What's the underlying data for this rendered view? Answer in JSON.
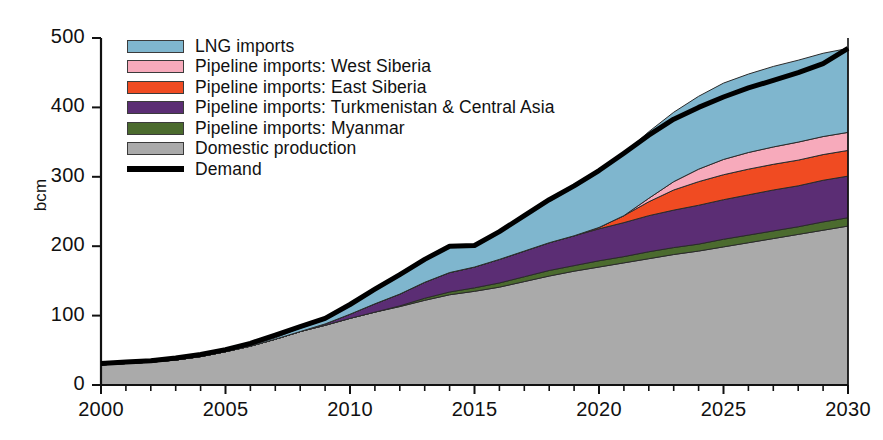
{
  "axes": {
    "y_label": "bcm",
    "y_ticks": [
      "0",
      "100",
      "200",
      "300",
      "400",
      "500"
    ],
    "x_ticks": [
      "2000",
      "2005",
      "2010",
      "2015",
      "2020",
      "2025",
      "2030"
    ]
  },
  "legend": {
    "items": [
      {
        "label": "LNG imports",
        "color": "#7FB6CE",
        "type": "area"
      },
      {
        "label": "Pipeline imports: West Siberia",
        "color": "#F7AABB",
        "type": "area"
      },
      {
        "label": "Pipeline imports: East Siberia",
        "color": "#F04B22",
        "type": "area"
      },
      {
        "label": "Pipeline imports: Turkmenistan & Central Asia",
        "color": "#5B2D74",
        "type": "area"
      },
      {
        "label": "Pipeline imports: Myanmar",
        "color": "#4B6B2E",
        "type": "area"
      },
      {
        "label": "Domestic production",
        "color": "#AAAAAA",
        "type": "area"
      },
      {
        "label": "Demand",
        "color": "#000000",
        "type": "line"
      }
    ]
  },
  "chart_data": {
    "type": "area",
    "title": "",
    "xlabel": "",
    "ylabel": "bcm",
    "xlim": [
      2000,
      2030
    ],
    "ylim": [
      0,
      500
    ],
    "grid": false,
    "legend_position": "top-left-inside",
    "stacked": true,
    "x": [
      2000,
      2001,
      2002,
      2003,
      2004,
      2005,
      2006,
      2007,
      2008,
      2009,
      2010,
      2011,
      2012,
      2013,
      2014,
      2015,
      2016,
      2017,
      2018,
      2019,
      2020,
      2021,
      2022,
      2023,
      2024,
      2025,
      2026,
      2027,
      2028,
      2029,
      2030
    ],
    "series": [
      {
        "name": "Domestic production",
        "color": "#AAAAAA",
        "values": [
          29,
          31,
          33,
          36,
          41,
          48,
          56,
          66,
          77,
          86,
          96,
          105,
          113,
          122,
          130,
          135,
          141,
          149,
          157,
          164,
          170,
          176,
          182,
          188,
          193,
          199,
          205,
          211,
          217,
          223,
          229
        ]
      },
      {
        "name": "Pipeline imports: Myanmar",
        "color": "#4B6B2E",
        "values": [
          0,
          0,
          0,
          0,
          0,
          0,
          0,
          0,
          0,
          0,
          0,
          0,
          1,
          3,
          4,
          5,
          6,
          7,
          8,
          8,
          9,
          9,
          10,
          10,
          10,
          11,
          11,
          11,
          11,
          12,
          12
        ]
      },
      {
        "name": "Pipeline imports: Turkmenistan & Central Asia",
        "color": "#5B2D74",
        "values": [
          0,
          0,
          0,
          0,
          0,
          0,
          0,
          0,
          0,
          2,
          6,
          12,
          17,
          23,
          28,
          30,
          34,
          37,
          40,
          43,
          46,
          49,
          52,
          54,
          56,
          57,
          58,
          59,
          59,
          60,
          60
        ]
      },
      {
        "name": "Pipeline imports: East Siberia",
        "color": "#F04B22",
        "values": [
          0,
          0,
          0,
          0,
          0,
          0,
          0,
          0,
          0,
          0,
          0,
          0,
          0,
          0,
          0,
          0,
          0,
          0,
          0,
          0,
          2,
          10,
          20,
          29,
          34,
          36,
          37,
          37,
          37,
          37,
          37
        ]
      },
      {
        "name": "Pipeline imports: West Siberia",
        "color": "#F7AABB",
        "values": [
          0,
          0,
          0,
          0,
          0,
          0,
          0,
          0,
          0,
          0,
          0,
          0,
          0,
          0,
          0,
          0,
          0,
          0,
          0,
          0,
          0,
          0,
          5,
          12,
          18,
          22,
          24,
          25,
          26,
          26,
          26
        ]
      },
      {
        "name": "LNG imports",
        "color": "#7FB6CE",
        "values": [
          0,
          0,
          0,
          0,
          0,
          0,
          1,
          2,
          5,
          6,
          13,
          20,
          27,
          32,
          38,
          31,
          40,
          51,
          62,
          72,
          82,
          90,
          96,
          100,
          105,
          110,
          113,
          116,
          118,
          120,
          121
        ]
      }
    ],
    "demand_line": {
      "name": "Demand",
      "color": "#000000",
      "values": [
        31,
        33,
        35,
        39,
        44,
        51,
        60,
        72,
        84,
        96,
        116,
        138,
        159,
        181,
        200,
        201,
        221,
        244,
        267,
        287,
        309,
        334,
        360,
        383,
        400,
        415,
        428,
        439,
        450,
        463,
        485
      ]
    }
  }
}
